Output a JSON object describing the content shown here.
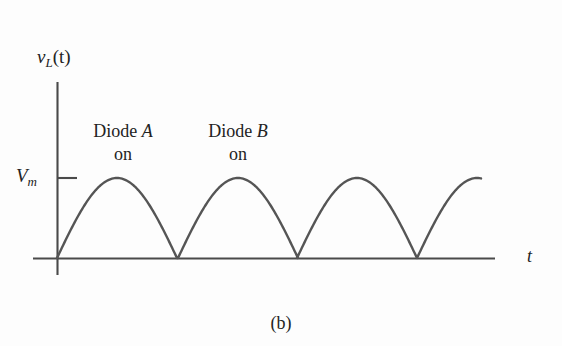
{
  "figure": {
    "caption": "(b)",
    "background_color": "#fdfdfd",
    "line_color": "#555555",
    "axis_color": "#4a4a4a",
    "text_color": "#232323"
  },
  "axes": {
    "y_axis": {
      "label_main": "v",
      "label_sub": "L",
      "label_paren": "(t)",
      "label_full": "v_L(t)",
      "tick_label_main": "V",
      "tick_label_sub": "m",
      "tick_label_full": "V_m",
      "tick_value_y": 178,
      "x_px": 57,
      "top_px": 82,
      "bottom_px": 275
    },
    "x_axis": {
      "label": "t",
      "y_px": 258,
      "left_px": 33,
      "right_px": 495
    }
  },
  "annotations": [
    {
      "name": "diode-a",
      "line1_prefix": "Diode ",
      "line1_italic": "A",
      "line2": "on",
      "x_px": 123,
      "y_px": 122
    },
    {
      "name": "diode-b",
      "line1_prefix": "Diode ",
      "line1_italic": "B",
      "line2": "on",
      "x_px": 238,
      "y_px": 122
    }
  ],
  "chart_data": {
    "type": "line",
    "title": "",
    "subtitle": "",
    "xlabel": "t",
    "ylabel": "v_L(t)",
    "grid": false,
    "legend": null,
    "waveform": {
      "form": "abs(sin)",
      "amplitude_label": "V_m",
      "amplitude_px": 80,
      "baseline_y_px": 258,
      "peak_y_px": 178,
      "half_period_px": 120,
      "zero_crossings_px": [
        57,
        178,
        297,
        417
      ],
      "peaks_px": [
        {
          "x": 117,
          "y": 178
        },
        {
          "x": 237,
          "y": 178
        },
        {
          "x": 357,
          "y": 178
        },
        {
          "x": 477,
          "y": 178
        }
      ],
      "arc_count": 4,
      "last_arc_truncated_at_px": {
        "x": 481,
        "y": 181
      },
      "series": [
        {
          "name": "v_L(t)",
          "x": [
            0.0,
            0.125,
            0.25,
            0.375,
            0.5,
            0.625,
            0.75,
            0.875,
            1.0,
            1.125,
            1.25,
            1.375,
            1.5,
            1.625,
            1.75,
            1.875,
            2.0,
            2.125,
            2.25,
            2.375,
            2.5,
            2.625,
            2.75,
            2.875,
            3.0,
            3.125,
            3.25,
            3.375,
            3.5
          ],
          "values": [
            0.0,
            0.383,
            0.707,
            0.924,
            1.0,
            0.924,
            0.707,
            0.383,
            0.0,
            0.383,
            0.707,
            0.924,
            1.0,
            0.924,
            0.707,
            0.383,
            0.0,
            0.383,
            0.707,
            0.924,
            1.0,
            0.924,
            0.707,
            0.383,
            0.0,
            0.383,
            0.707,
            0.924,
            1.0
          ]
        }
      ],
      "xlim": [
        0,
        3.6
      ],
      "ylim": [
        0,
        1.05
      ],
      "yticks": [
        {
          "value": 1.0,
          "label": "V_m"
        }
      ]
    }
  }
}
